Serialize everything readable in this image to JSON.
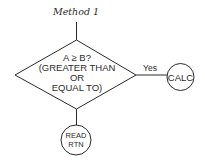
{
  "title": "Method 1",
  "decision": {
    "lines": [
      "A ≥ B?",
      "(GREATER THAN",
      "OR",
      "EQUAL TO)"
    ]
  },
  "edges": {
    "yes_label": "Yes"
  },
  "nodes": {
    "calc": {
      "label": "CALC"
    },
    "read_rtn": {
      "lines": [
        "READ",
        "RTN"
      ]
    }
  },
  "colors": {
    "ink": "#2a2a2a",
    "background": "#ffffff"
  }
}
